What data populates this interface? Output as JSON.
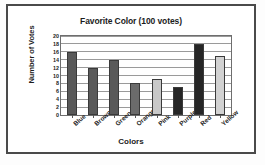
{
  "chart_data": {
    "type": "bar",
    "title": "Favorite Color (100 votes)",
    "xlabel": "Colors",
    "ylabel": "Number of Votes",
    "categories": [
      "Blue",
      "Brown",
      "Green",
      "Orange",
      "Pink",
      "Purple",
      "Red",
      "Yellow"
    ],
    "values": [
      16,
      12,
      14,
      8,
      9,
      7,
      18,
      15
    ],
    "bar_colors": [
      "#595959",
      "#595959",
      "#595959",
      "#6b6b6b",
      "#c8c8c8",
      "#262626",
      "#262626",
      "#d2d2d2"
    ],
    "ylim": [
      0,
      20
    ],
    "ytick_step": 2,
    "yticks": [
      0,
      2,
      4,
      6,
      8,
      10,
      12,
      14,
      16,
      18,
      20
    ],
    "ytick_labels": [
      "0",
      "2",
      "4",
      "6",
      "8",
      "10",
      "12",
      "14",
      "16",
      "18",
      "20"
    ],
    "grid": true,
    "grid_axis": "y",
    "legend": false,
    "xtick_rotation": -42
  },
  "style": {
    "frame_color": "#4a4a4a",
    "axis_color": "#6e6e6e",
    "grid_color": "#9a9a9a",
    "text_color": "#1c1c1c",
    "background": "#ffffff"
  }
}
